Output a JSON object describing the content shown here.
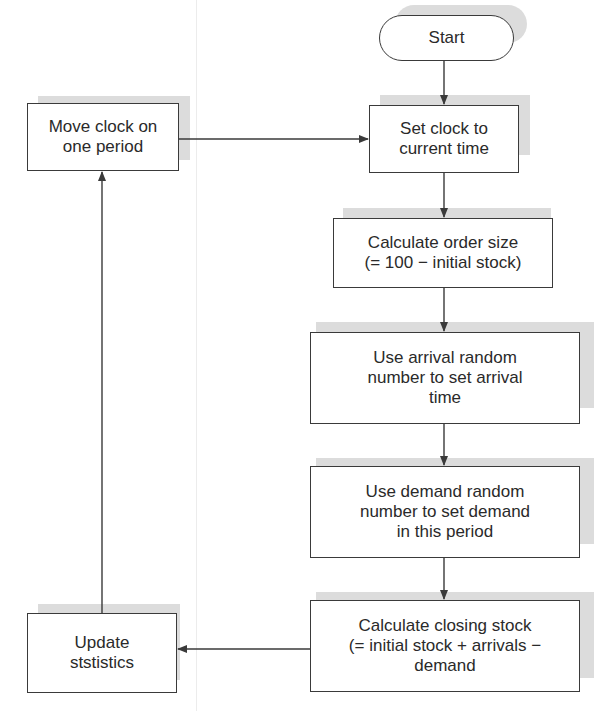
{
  "diagram": {
    "nodes": [
      {
        "id": "start",
        "type": "terminal",
        "label": "Start"
      },
      {
        "id": "set-clock",
        "type": "process",
        "label": "Set clock to\ncurrent time"
      },
      {
        "id": "calc-order",
        "type": "process",
        "label": "Calculate order size\n(= 100 − initial stock)"
      },
      {
        "id": "arrival",
        "type": "process",
        "label": "Use arrival random\nnumber to set arrival\ntime"
      },
      {
        "id": "demand",
        "type": "process",
        "label": "Use demand random\nnumber to set demand\nin this period"
      },
      {
        "id": "closing",
        "type": "process",
        "label": "Calculate closing stock\n(= initial stock + arrivals −\ndemand"
      },
      {
        "id": "update-stats",
        "type": "process",
        "label": "Update\nststistics"
      },
      {
        "id": "move-clock",
        "type": "process",
        "label": "Move clock on\none period"
      }
    ],
    "edges": [
      {
        "from": "start",
        "to": "set-clock"
      },
      {
        "from": "set-clock",
        "to": "calc-order"
      },
      {
        "from": "calc-order",
        "to": "arrival"
      },
      {
        "from": "arrival",
        "to": "demand"
      },
      {
        "from": "demand",
        "to": "closing"
      },
      {
        "from": "closing",
        "to": "update-stats"
      },
      {
        "from": "update-stats",
        "to": "move-clock"
      },
      {
        "from": "move-clock",
        "to": "set-clock"
      }
    ],
    "colors": {
      "stroke": "#3a3a3a",
      "shadow": "#dcdcdc",
      "fill": "#ffffff"
    }
  }
}
